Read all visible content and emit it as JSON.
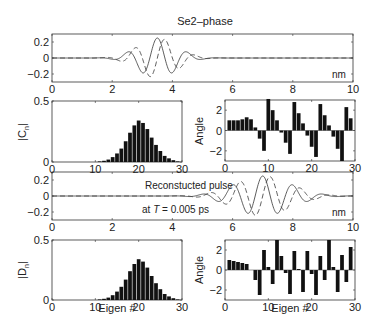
{
  "chart_data": [
    {
      "id": "top-wave",
      "type": "line",
      "title": "Se2–phase",
      "xlabel": "nm",
      "xlim": [
        0,
        10
      ],
      "ylim": [
        -0.3,
        0.3
      ],
      "xticks": [
        "0",
        "2",
        "4",
        "6",
        "8",
        "10"
      ],
      "yticks": [
        "0.2",
        "0",
        "−0.2"
      ],
      "series": [
        {
          "name": "real",
          "style": "solid",
          "center": 3.5,
          "amplitude": 0.25,
          "width": 0.9,
          "period": 1.0
        },
        {
          "name": "imag",
          "style": "dashed",
          "center": 3.5,
          "amplitude": 0.25,
          "width": 0.9,
          "period": 1.0
        }
      ]
    },
    {
      "id": "cn-mag",
      "type": "bar",
      "ylabel": "|C_n|",
      "xlim": [
        0,
        30
      ],
      "ylim": [
        0,
        0.5
      ],
      "xticks": [
        "0",
        "10",
        "20",
        "30"
      ],
      "yticks": [
        "0.5",
        "0"
      ],
      "x": [
        1,
        2,
        3,
        4,
        5,
        6,
        7,
        8,
        9,
        10,
        11,
        12,
        13,
        14,
        15,
        16,
        17,
        18,
        19,
        20,
        21,
        22,
        23,
        24,
        25,
        26,
        27,
        28,
        29
      ],
      "values": [
        0,
        0,
        0,
        0,
        0,
        0,
        0,
        0,
        0,
        0,
        0.005,
        0.01,
        0.02,
        0.04,
        0.07,
        0.11,
        0.17,
        0.24,
        0.3,
        0.34,
        0.32,
        0.27,
        0.2,
        0.14,
        0.09,
        0.05,
        0.03,
        0.015,
        0.005
      ]
    },
    {
      "id": "cn-angle",
      "type": "bar",
      "ylabel": "Angle",
      "xlim": [
        0,
        30
      ],
      "ylim": [
        -3,
        3
      ],
      "xticks": [
        "0",
        "10",
        "20",
        "30"
      ],
      "yticks": [
        "2",
        "0",
        "−2"
      ],
      "x": [
        1,
        2,
        3,
        4,
        5,
        6,
        7,
        8,
        9,
        10,
        11,
        12,
        13,
        14,
        15,
        16,
        17,
        18,
        19,
        20,
        21,
        22,
        23,
        24,
        25,
        26,
        27,
        28,
        29
      ],
      "values": [
        1.0,
        1.0,
        1.0,
        1.1,
        1.3,
        1.1,
        0.3,
        -0.8,
        -2.0,
        3.1,
        2.0,
        1.0,
        -0.2,
        -1.2,
        -2.3,
        2.8,
        1.7,
        0.7,
        -0.5,
        -1.6,
        -2.6,
        2.6,
        1.5,
        0.5,
        -0.6,
        -1.8,
        -3.0,
        2.3,
        1.2
      ]
    },
    {
      "id": "bottom-wave",
      "type": "line",
      "title": "Reconstucted pulse",
      "annotation": "at T = 0.005 ps",
      "xlabel": "nm",
      "xlim": [
        0,
        10
      ],
      "ylim": [
        -0.3,
        0.3
      ],
      "xticks": [
        "0",
        "2",
        "4",
        "6",
        "8",
        "10"
      ],
      "yticks": [
        "0.2",
        "0",
        "−0.2"
      ],
      "series": [
        {
          "name": "real",
          "style": "solid",
          "center": 7.0,
          "amplitude": 0.25,
          "width": 1.3,
          "period": 1.0
        },
        {
          "name": "imag",
          "style": "dashed",
          "center": 7.0,
          "amplitude": 0.25,
          "width": 1.3,
          "period": 1.0
        }
      ]
    },
    {
      "id": "dn-mag",
      "type": "bar",
      "ylabel": "|D_n|",
      "xlabel": "Eigen #",
      "xlim": [
        0,
        30
      ],
      "ylim": [
        0,
        0.5
      ],
      "xticks": [
        "0",
        "10",
        "20",
        "30"
      ],
      "yticks": [
        "0.5",
        "0"
      ],
      "x": [
        1,
        2,
        3,
        4,
        5,
        6,
        7,
        8,
        9,
        10,
        11,
        12,
        13,
        14,
        15,
        16,
        17,
        18,
        19,
        20,
        21,
        22,
        23,
        24,
        25,
        26,
        27,
        28,
        29
      ],
      "values": [
        0,
        0,
        0,
        0,
        0,
        0,
        0,
        0,
        0,
        0,
        0.005,
        0.01,
        0.02,
        0.04,
        0.07,
        0.11,
        0.17,
        0.24,
        0.3,
        0.34,
        0.32,
        0.27,
        0.2,
        0.14,
        0.09,
        0.05,
        0.03,
        0.015,
        0.005
      ]
    },
    {
      "id": "dn-angle",
      "type": "bar",
      "ylabel": "Angle",
      "xlabel": "Eigen #",
      "xlim": [
        0,
        30
      ],
      "ylim": [
        -3,
        3
      ],
      "xticks": [
        "0",
        "10",
        "20",
        "30"
      ],
      "yticks": [
        "2",
        "0",
        "−2"
      ],
      "x": [
        1,
        2,
        3,
        4,
        5,
        6,
        7,
        8,
        9,
        10,
        11,
        12,
        13,
        14,
        15,
        16,
        17,
        18,
        19,
        20,
        21,
        22,
        23,
        24,
        25,
        26,
        27,
        28,
        29
      ],
      "values": [
        1.0,
        0.9,
        0.8,
        0.7,
        0.6,
        0.0,
        -1.0,
        -2.5,
        2.0,
        0.3,
        -1.4,
        3.0,
        1.4,
        -0.3,
        -2.4,
        1.9,
        0.1,
        -2.2,
        1.9,
        -0.4,
        -2.5,
        1.4,
        -1.0,
        3.0,
        0.3,
        -2.2,
        1.5,
        -1.2,
        2.3
      ]
    }
  ],
  "labels": {
    "title": "Se2–phase",
    "reconstructed": "Reconstucted pulse",
    "at_prefix": "at ",
    "at_T": "T",
    "at_suffix": " = 0.005 ps",
    "nm": "nm",
    "cn_label": "|C",
    "cn_sub": "n",
    "dn_label": "|D",
    "dn_sub": "n",
    "angle": "Angle",
    "eigen": "Eigen #"
  }
}
